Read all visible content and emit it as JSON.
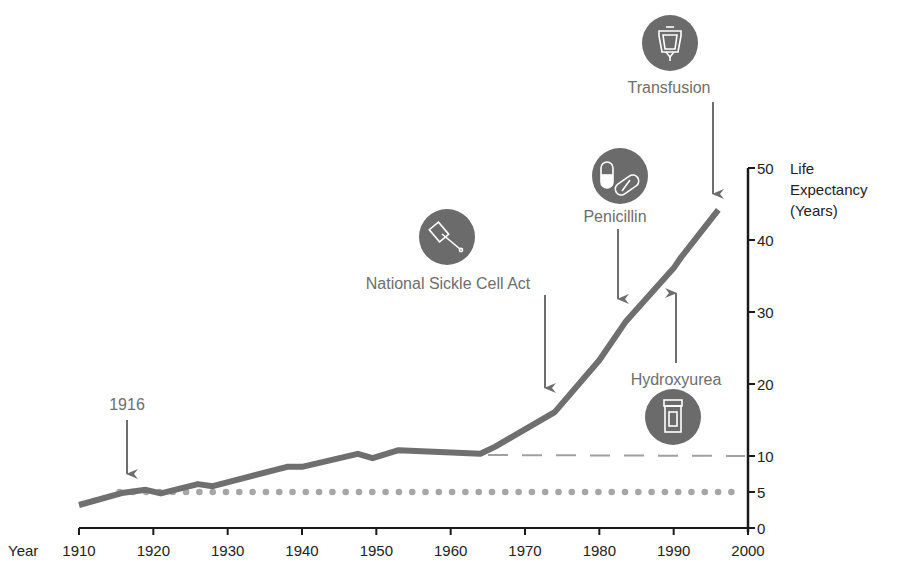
{
  "chart_data": {
    "type": "line",
    "title": "",
    "xlabel": "Year",
    "ylabel": "Life Expectancy (Years)",
    "ylabel_lines": [
      "Life",
      "Expectancy",
      "(Years)"
    ],
    "xlim": [
      1910,
      2000
    ],
    "ylim": [
      0,
      50
    ],
    "x_ticks": [
      1910,
      1920,
      1930,
      1940,
      1950,
      1960,
      1970,
      1980,
      1990,
      2000
    ],
    "y_ticks": [
      0,
      5,
      10,
      20,
      30,
      40,
      50
    ],
    "grid": false,
    "y_axis_position": "right",
    "series": [
      {
        "name": "Life expectancy (sickle cell disease)",
        "style": "solid-thick",
        "color": "#6f6f6f",
        "x": [
          1910,
          1916,
          1919,
          1921,
          1926,
          1928,
          1938,
          1940,
          1947.5,
          1949.5,
          1953,
          1964,
          1966,
          1974,
          1980,
          1983.5,
          1990,
          1991,
          1996
        ],
        "y": [
          3.2,
          4.9,
          5.3,
          4.8,
          6.1,
          5.8,
          8.5,
          8.5,
          10.3,
          9.7,
          10.8,
          10.3,
          11.3,
          16.1,
          23.3,
          28.6,
          36.1,
          37.6,
          44.2
        ]
      },
      {
        "name": "Baseline 10 years (projected without intervention)",
        "style": "dashed",
        "color": "#9a9a9a",
        "x": [
          1964,
          2000
        ],
        "y": [
          10.3,
          10
        ]
      },
      {
        "name": "Baseline 5 years",
        "style": "dotted",
        "color": "#a0a0a0",
        "x": [
          1916,
          2000
        ],
        "y": [
          5,
          5
        ]
      }
    ],
    "annotations": [
      {
        "label": "1916",
        "year": 1916,
        "arrow": "down",
        "icon": null
      },
      {
        "label": "National Sickle Cell Act",
        "year": 1972,
        "arrow": "down",
        "icon": "gavel-icon"
      },
      {
        "label": "Penicillin",
        "year": 1986,
        "arrow": "down",
        "icon": "pills-icon"
      },
      {
        "label": "Hydroxyurea",
        "year": 1995,
        "arrow": "up",
        "icon": "pill-bottle-icon"
      },
      {
        "label": "Transfusion",
        "year": 1997,
        "arrow": "down",
        "icon": "iv-bag-icon"
      }
    ],
    "legend": null
  },
  "axes": {
    "x_label": "Year",
    "x_ticks": [
      "1910",
      "1920",
      "1930",
      "1940",
      "1950",
      "1960",
      "1970",
      "1980",
      "1990",
      "2000"
    ],
    "y_ticks": [
      "0",
      "5",
      "10",
      "20",
      "30",
      "40",
      "50"
    ],
    "y_title": [
      "Life",
      "Expectancy",
      "(Years)"
    ]
  },
  "annotations": {
    "a1916": "1916",
    "act": "National Sickle Cell Act",
    "penicillin": "Penicillin",
    "hydroxyurea": "Hydroxyurea",
    "transfusion": "Transfusion"
  },
  "colors": {
    "curve": "#6f6f6f",
    "annotation": "#6e6e6e",
    "icon_fill": "#6b6b6b",
    "dots": "#a6a6a6",
    "dashes": "#a0a0a0",
    "axis": "#1a1a1a"
  }
}
